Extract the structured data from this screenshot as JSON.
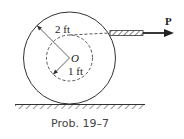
{
  "diagram": {
    "outer_radius_label": "2 ft",
    "inner_radius_label": "1 ft",
    "center_label": "O",
    "force_label": "P",
    "caption": "Prob. 19–7"
  }
}
